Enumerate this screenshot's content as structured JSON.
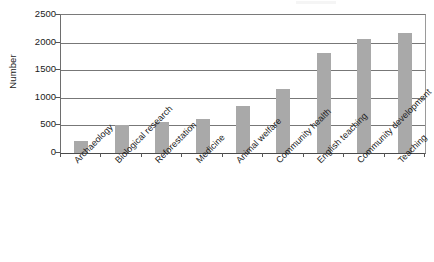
{
  "chart_data": {
    "type": "bar",
    "title": "",
    "xlabel": "",
    "ylabel": "Number",
    "ylim": [
      0,
      2500
    ],
    "ytick_step": 500,
    "grid": true,
    "legend": "none",
    "bar_color": "#a9a9a9",
    "axis_color": "#555555",
    "categories": [
      "Archaeology",
      "Biological research",
      "Reforestation",
      "Medicine",
      "Animal welfare",
      "Community health",
      "English teaching",
      "Community development",
      "Teaching"
    ],
    "values": [
      210,
      505,
      560,
      625,
      855,
      1155,
      1815,
      2060,
      2180
    ],
    "ytick_labels": [
      "2500",
      "2000",
      "1500",
      "1000",
      "500",
      "0"
    ],
    "ytick_values": [
      2500,
      2000,
      1500,
      1000,
      500,
      0
    ]
  },
  "axes": {
    "y_title": "Number"
  }
}
